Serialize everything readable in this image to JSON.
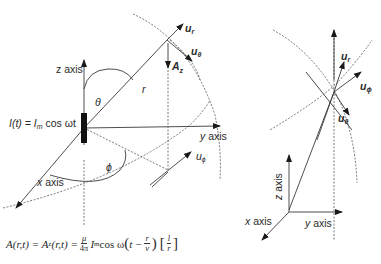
{
  "left_diagram": {
    "labels": {
      "z_axis": "z axis",
      "y_axis": "y axis",
      "x_axis": "x axis",
      "theta": "θ",
      "phi": "ϕ",
      "r": "r",
      "u_r": "u",
      "u_r_sub": "r",
      "u_theta": "u",
      "u_theta_sub": "θ",
      "u_phi": "u",
      "u_phi_sub": "ϕ",
      "A_z": "A",
      "A_z_sub": "z",
      "current": "I(t) = I",
      "current_sub": "m",
      "current_rest": " cos ωt"
    }
  },
  "right_diagram": {
    "labels": {
      "z_axis": "z axis",
      "y_axis": "y axis",
      "x_axis": "x axis",
      "u_r": "u",
      "u_r_sub": "r",
      "u_phi": "u",
      "u_phi_sub": "ϕ",
      "u_theta": "u",
      "u_theta_sub": "θ"
    }
  },
  "formula": {
    "lhs": "A(r,t) = A",
    "lhs_sub": "z",
    "lhs_rest": "(r,t) = ",
    "frac1_num": "μ",
    "frac1_den": "4π",
    "term": "I",
    "term_sub": "m",
    "cos": " cos ω",
    "inner_t": "t − ",
    "frac2_num": "r",
    "frac2_den": "v",
    "frac3_num": "l",
    "frac3_den": "r"
  }
}
